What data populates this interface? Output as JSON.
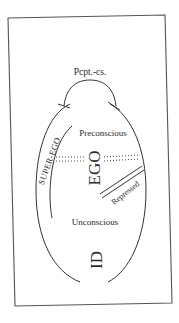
{
  "diagram": {
    "labels": {
      "perception": "Pcpt.-cs.",
      "preconscious": "Preconscious",
      "superego": "SUPER-EGO",
      "ego": "EGO",
      "repressed": "Repressed",
      "unconscious": "Unconscious",
      "id": "ID"
    },
    "colors": {
      "line": "#3a3a3a",
      "text": "#2a2a2a",
      "background": "#ffffff"
    }
  }
}
